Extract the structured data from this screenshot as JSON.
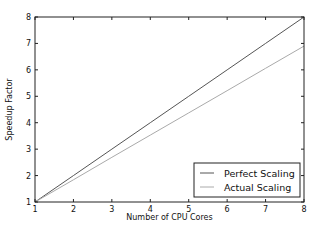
{
  "chart_data": {
    "type": "line",
    "title": "",
    "xlabel": "Number of CPU Cores",
    "ylabel": "Speedup Factor",
    "xlim": [
      1,
      8
    ],
    "ylim": [
      1,
      8
    ],
    "xticks": [
      1,
      2,
      3,
      4,
      5,
      6,
      7,
      8
    ],
    "yticks": [
      1,
      2,
      3,
      4,
      5,
      6,
      7,
      8
    ],
    "grid": false,
    "legend_position": "lower right",
    "x": [
      1,
      2,
      3,
      4,
      5,
      6,
      7,
      8
    ],
    "series": [
      {
        "name": "Perfect Scaling",
        "color": "#555555",
        "values": [
          1,
          2,
          3,
          4,
          5,
          6,
          7,
          8
        ]
      },
      {
        "name": "Actual Scaling",
        "color": "#aaaaaa",
        "values": [
          1,
          1.84,
          2.69,
          3.53,
          4.37,
          5.21,
          6.06,
          6.9
        ]
      }
    ]
  }
}
